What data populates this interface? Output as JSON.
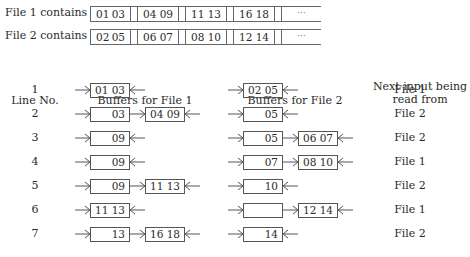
{
  "files": [
    {
      "label": "File 1 contains",
      "records": [
        [
          "01",
          "03"
        ],
        [
          "04",
          "09"
        ],
        [
          "11",
          "13"
        ],
        [
          "16",
          "18"
        ]
      ],
      "ellipsis": "···"
    },
    {
      "label": "File 2 contains",
      "records": [
        [
          "02",
          "05"
        ],
        [
          "06",
          "07"
        ],
        [
          "08",
          "10"
        ],
        [
          "12",
          "14"
        ]
      ],
      "ellipsis": "···"
    }
  ],
  "headers": {
    "line_no": "Line No.",
    "buffers_file1": "Buffers for File 1",
    "buffers_file2": "Buffers for File 2",
    "next_input_line1": "Next input being",
    "next_input_line2": "read from"
  },
  "rows": [
    {
      "line": "1",
      "file1": [
        {
          "a": "01",
          "b": "03"
        }
      ],
      "file2": [
        {
          "a": "02",
          "b": "05"
        }
      ],
      "next": "File 1"
    },
    {
      "line": "2",
      "file1": [
        {
          "a": "",
          "b": "03"
        },
        {
          "a": "04",
          "b": "09"
        }
      ],
      "file2": [
        {
          "a": "",
          "b": "05"
        }
      ],
      "next": "File 2"
    },
    {
      "line": "3",
      "file1": [
        {
          "a": "",
          "b": "09"
        }
      ],
      "file2": [
        {
          "a": "",
          "b": "05"
        },
        {
          "a": "06",
          "b": "07"
        }
      ],
      "next": "File 2"
    },
    {
      "line": "4",
      "file1": [
        {
          "a": "",
          "b": "09"
        }
      ],
      "file2": [
        {
          "a": "",
          "b": "07"
        },
        {
          "a": "08",
          "b": "10"
        }
      ],
      "next": "File 1"
    },
    {
      "line": "5",
      "file1": [
        {
          "a": "",
          "b": "09"
        },
        {
          "a": "11",
          "b": "13"
        }
      ],
      "file2": [
        {
          "a": "",
          "b": "10"
        }
      ],
      "next": "File 2"
    },
    {
      "line": "6",
      "file1": [
        {
          "a": "11",
          "b": "13"
        }
      ],
      "file2": [
        {
          "a": "",
          "b": ""
        },
        {
          "a": "12",
          "b": "14"
        }
      ],
      "next": "File 1"
    },
    {
      "line": "7",
      "file1": [
        {
          "a": "",
          "b": "13"
        },
        {
          "a": "16",
          "b": "18"
        }
      ],
      "file2": [
        {
          "a": "",
          "b": "14"
        }
      ],
      "next": "File 2"
    }
  ]
}
